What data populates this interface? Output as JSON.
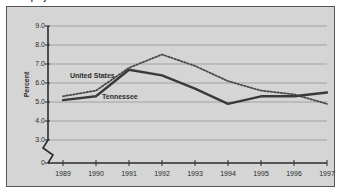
{
  "figure": {
    "title": "Unemployment Rate",
    "background_color": "#d5d5d5",
    "border_color": "#555555",
    "page_background": "#ffffff"
  },
  "chart_data": {
    "type": "line",
    "title": "Unemployment Rate",
    "xlabel": "",
    "ylabel": "Percent",
    "x": [
      1989,
      1990,
      1991,
      1992,
      1993,
      1994,
      1995,
      1996,
      1997
    ],
    "categories": [
      "1989",
      "1990",
      "1991",
      "1992",
      "1993",
      "1994",
      "1995",
      "1996",
      "1997"
    ],
    "series": [
      {
        "name": "United States",
        "style": "dotted",
        "color": "#4a4a4a",
        "values": [
          5.3,
          5.6,
          6.8,
          7.5,
          6.9,
          6.1,
          5.6,
          5.4,
          4.9
        ]
      },
      {
        "name": "Tennessee",
        "style": "solid",
        "color": "#3a3a3a",
        "values": [
          5.1,
          5.3,
          6.7,
          6.4,
          5.7,
          4.9,
          5.3,
          5.3,
          5.5
        ]
      }
    ],
    "ylim": [
      3.0,
      9.0
    ],
    "yticks": [
      "9.0",
      "8.0",
      "7.0",
      "6.0",
      "5.0",
      "4.0",
      "3.0",
      "0"
    ],
    "ytick_values": [
      9.0,
      8.0,
      7.0,
      6.0,
      5.0,
      4.0,
      3.0,
      0
    ],
    "axis_break": true,
    "axis_break_note": "zigzag break on y-axis between 3.0 and 0",
    "grid": true,
    "grid_axis": "y",
    "legend": "inline-labels",
    "legend_position": "in-plot"
  }
}
